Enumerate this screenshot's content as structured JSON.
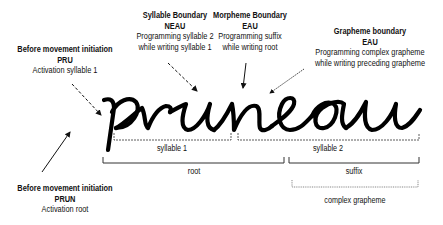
{
  "word": "pruneau",
  "annotations": {
    "before_syllable": {
      "title": "Before movement initiation",
      "code": "PRU",
      "desc": "Activation syllable 1"
    },
    "syllable_boundary": {
      "title": "Syllable Boundary",
      "code": "NEAU",
      "desc1": "Programming syllable 2",
      "desc2": "while writing syllable 1"
    },
    "morpheme_boundary": {
      "title": "Morpheme Boundary",
      "code": "EAU",
      "desc1": "Programming suffix",
      "desc2": "while writing root"
    },
    "grapheme_boundary": {
      "title": "Grapheme boundary",
      "code": "EAU",
      "desc1": "Programming complex grapheme",
      "desc2": "while writing preceding grapheme"
    },
    "before_root": {
      "title": "Before movement initiation",
      "code": "PRUN",
      "desc": "Activation root"
    }
  },
  "brackets": {
    "syllable1": "syllable 1",
    "syllable2": "syllable 2",
    "root": "root",
    "suffix": "suffix",
    "complex_grapheme": "complex  grapheme"
  }
}
